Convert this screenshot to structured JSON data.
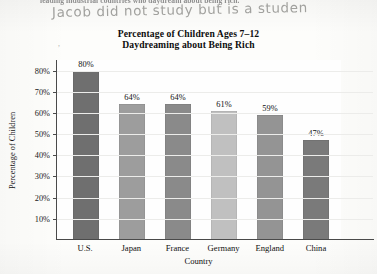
{
  "annotations": {
    "cut_off_printed_line": "leading industrial countries who daydream about being rich.",
    "handwritten_note": "Jacob did not study but is a studen"
  },
  "chart_data": {
    "type": "bar",
    "title_line1": "Percentage of Children Ages 7–12",
    "title_line2": "Daydreaming about Being Rich",
    "xlabel": "Country",
    "ylabel": "Percentage of Children",
    "categories": [
      "U.S.",
      "Japan",
      "France",
      "Germany",
      "England",
      "China"
    ],
    "values": [
      80,
      64,
      64,
      61,
      59,
      47
    ],
    "value_labels": [
      "80%",
      "64%",
      "64%",
      "61%",
      "59%",
      "47%"
    ],
    "bar_colors": [
      "#6f6f6f",
      "#9d9d9d",
      "#8a8a8a",
      "#c0c0c0",
      "#949494",
      "#7a7a7a"
    ],
    "ylim": [
      0,
      85
    ],
    "ytick_values": [
      10,
      20,
      30,
      40,
      50,
      60,
      70,
      80
    ],
    "ytick_labels": [
      "10%",
      "20%",
      "30%",
      "40%",
      "50%",
      "60%",
      "70%",
      "80%"
    ],
    "grid": true,
    "legend": "none",
    "stray_mark": "’"
  }
}
